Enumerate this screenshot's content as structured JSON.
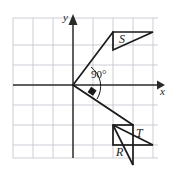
{
  "figure": {
    "kind": "coordinate-grid-geometry-diagram",
    "width": 175,
    "height": 170,
    "background_color": "#ffffff",
    "ink_color": "#1a1a1a",
    "grid": {
      "line_color": "#b9b9c4",
      "border_color": "#b9b9c4",
      "cell_size_px": 20,
      "left_px": 13,
      "top_px": 18,
      "right_px": 158,
      "bottom_px": 158,
      "columns": 7,
      "rows": 7
    },
    "axes": {
      "color": "#2a2a2a",
      "origin_px": {
        "x": 73,
        "y": 85
      },
      "x_axis": {
        "label": "x",
        "label_x_px": 160,
        "label_y_px": 90,
        "arrow": "right"
      },
      "y_axis": {
        "label": "y",
        "label_x_px": 64,
        "label_y_px": 17,
        "arrow": "up"
      }
    },
    "angle_marker": {
      "label": "90°",
      "label_x_px": 91,
      "label_y_px": 69,
      "arc_radius_px": 24,
      "right_angle_square": true
    },
    "rays": [
      {
        "name": "ray-to-S",
        "from_px": {
          "x": 73,
          "y": 85
        },
        "to_px": {
          "x": 113,
          "y": 32
        },
        "arrowhead": false
      },
      {
        "name": "ray-to-R",
        "from_px": {
          "x": 73,
          "y": 85
        },
        "to_px": {
          "x": 133,
          "y": 125
        },
        "arrowhead": false
      }
    ],
    "arrow_marks": [
      {
        "name": "angle-direction-arrow",
        "x_px": 93,
        "y_px": 93
      }
    ],
    "shapes": [
      {
        "name": "triangle-S",
        "label": "S",
        "label_x_px": 119,
        "label_y_px": 33,
        "points_px": "113,50 113,32 153,32",
        "closed": true
      },
      {
        "name": "triangle-T",
        "label": "T",
        "label_x_px": 136,
        "label_y_px": 129,
        "points_px": "113,125 113,145 153,145",
        "closed": false
      },
      {
        "name": "triangle-R",
        "label": "R",
        "label_x_px": 117,
        "label_y_px": 146,
        "points_px": "113,125 133,165 133,125",
        "closed": false
      }
    ],
    "extra_segments": [
      {
        "name": "seg-S-box-left",
        "x1_px": 113,
        "y1_px": 32,
        "x2_px": 113,
        "y2_px": 50
      },
      {
        "name": "seg-S-box-top",
        "x1_px": 113,
        "y1_px": 32,
        "x2_px": 153,
        "y2_px": 32
      },
      {
        "name": "seg-S-hyp",
        "x1_px": 113,
        "y1_px": 50,
        "x2_px": 153,
        "y2_px": 32
      },
      {
        "name": "seg-T-square-left",
        "x1_px": 113,
        "y1_px": 125,
        "x2_px": 113,
        "y2_px": 145
      },
      {
        "name": "seg-T-square-bottom",
        "x1_px": 113,
        "y1_px": 145,
        "x2_px": 133,
        "y2_px": 145
      },
      {
        "name": "seg-T-square-right",
        "x1_px": 133,
        "y1_px": 125,
        "x2_px": 133,
        "y2_px": 145
      },
      {
        "name": "seg-T-square-top",
        "x1_px": 113,
        "y1_px": 125,
        "x2_px": 133,
        "y2_px": 125
      },
      {
        "name": "seg-T-hyp",
        "x1_px": 113,
        "y1_px": 125,
        "x2_px": 153,
        "y2_px": 145
      },
      {
        "name": "seg-R-hyp",
        "x1_px": 113,
        "y1_px": 125,
        "x2_px": 133,
        "y2_px": 165
      },
      {
        "name": "seg-R-right",
        "x1_px": 133,
        "y1_px": 145,
        "x2_px": 133,
        "y2_px": 165
      }
    ]
  }
}
